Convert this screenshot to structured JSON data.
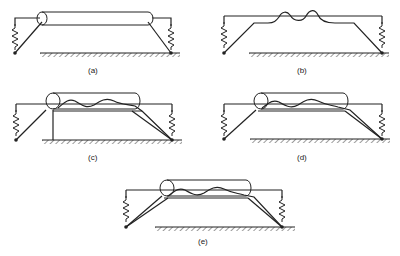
{
  "figure": {
    "panels": [
      {
        "id": "a",
        "label": "(a)",
        "description": "Rigid cylinder supported by two springs; link arms to ground pivots"
      },
      {
        "id": "b",
        "label": "(b)",
        "description": "Frame with wavy (deformed) flexible member, no cylinder"
      },
      {
        "id": "c",
        "label": "(c)",
        "description": "Cylinder with wavy member and vertical post support at left end"
      },
      {
        "id": "d",
        "label": "(d)",
        "description": "Cylinder with wavy member, double link arms to right pivot"
      },
      {
        "id": "e",
        "label": "(e)",
        "description": "Cylinder with wavy member, double link arms to both pivots"
      }
    ],
    "colors": {
      "line": "#222222",
      "background": "#ffffff"
    }
  }
}
